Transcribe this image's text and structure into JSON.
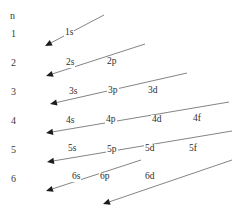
{
  "figure": {
    "type": "aufbau-diagonal-rule-diagram",
    "background_color": "#ffffff",
    "line_color": "#6e6e6e",
    "text_color": "#2e2e2e",
    "width": 241,
    "height": 214
  },
  "axis": {
    "header_label": "n",
    "header_x": 10,
    "header_y": 11,
    "rows": [
      {
        "label": "1",
        "x": 11,
        "y": 29
      },
      {
        "label": "2",
        "x": 11,
        "y": 58
      },
      {
        "label": "3",
        "x": 11,
        "y": 87
      },
      {
        "label": "4",
        "x": 11,
        "y": 116
      },
      {
        "label": "5",
        "x": 11,
        "y": 145
      },
      {
        "label": "6",
        "x": 11,
        "y": 174
      }
    ]
  },
  "orbitals": [
    {
      "label": "1s",
      "x": 64,
      "y": 28
    },
    {
      "label": "2s",
      "x": 65,
      "y": 58
    },
    {
      "label": "2p",
      "x": 106,
      "y": 57
    },
    {
      "label": "3s",
      "x": 68,
      "y": 87
    },
    {
      "label": "3p",
      "x": 107,
      "y": 86
    },
    {
      "label": "3d",
      "x": 147,
      "y": 86
    },
    {
      "label": "4s",
      "x": 65,
      "y": 116
    },
    {
      "label": "4p",
      "x": 105,
      "y": 115
    },
    {
      "label": "4d",
      "x": 151,
      "y": 115
    },
    {
      "label": "4f",
      "x": 192,
      "y": 114
    },
    {
      "label": "5s",
      "x": 67,
      "y": 144
    },
    {
      "label": "5p",
      "x": 106,
      "y": 145
    },
    {
      "label": "5d",
      "x": 144,
      "y": 144
    },
    {
      "label": "5f",
      "x": 188,
      "y": 144
    },
    {
      "label": "6s",
      "x": 71,
      "y": 172
    },
    {
      "label": "6p",
      "x": 99,
      "y": 172
    },
    {
      "label": "6d",
      "x": 144,
      "y": 172
    }
  ],
  "arrows": [
    {
      "name": "arrow-1s",
      "x1": 104,
      "y1": 15,
      "x2": 45,
      "y2": 46
    },
    {
      "name": "arrow-2s-2p",
      "x1": 145,
      "y1": 44,
      "x2": 46,
      "y2": 76
    },
    {
      "name": "arrow-3s-3d",
      "x1": 187,
      "y1": 73,
      "x2": 50,
      "y2": 104
    },
    {
      "name": "arrow-4s-4f",
      "x1": 229,
      "y1": 102,
      "x2": 46,
      "y2": 133
    },
    {
      "name": "arrow-5s-5f",
      "x1": 232,
      "y1": 131,
      "x2": 47,
      "y2": 162
    },
    {
      "name": "arrow-6s",
      "x1": 141,
      "y1": 160,
      "x2": 46,
      "y2": 191
    },
    {
      "name": "arrow-6p-6d",
      "x1": 232,
      "y1": 160,
      "x2": 103,
      "y2": 204
    }
  ]
}
